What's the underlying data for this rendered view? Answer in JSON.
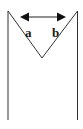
{
  "diagram": {
    "labels": {
      "a": "a",
      "b": "b"
    },
    "colors": {
      "stroke": "#333333",
      "background": "#ffffff"
    },
    "elements": [
      "left-vertical-line",
      "right-vertical-line",
      "v-shape",
      "double-headed-arrow",
      "label-a",
      "label-b"
    ]
  }
}
